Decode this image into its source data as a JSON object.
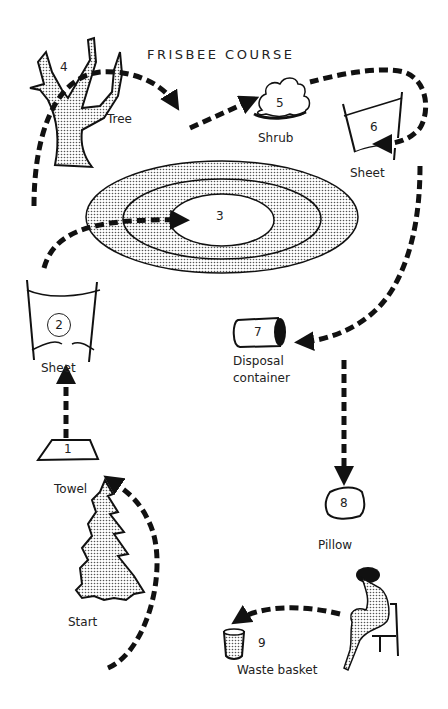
{
  "title": "FRISBEE COURSE",
  "stations": [
    {
      "number": "1",
      "label": "Towel"
    },
    {
      "number": "2",
      "label": "Sheet"
    },
    {
      "number": "3",
      "label": ""
    },
    {
      "number": "4",
      "label": "Tree"
    },
    {
      "number": "5",
      "label": "Shrub"
    },
    {
      "number": "6",
      "label": "Sheet"
    },
    {
      "number": "7",
      "label_line1": "Disposal",
      "label_line2": "container"
    },
    {
      "number": "8",
      "label": "Pillow"
    },
    {
      "number": "9",
      "label": "Waste basket"
    }
  ],
  "start_label": "Start",
  "colors": {
    "ink": "#1a1a1a",
    "stipple": "#bdbdbd",
    "background": "#ffffff"
  }
}
